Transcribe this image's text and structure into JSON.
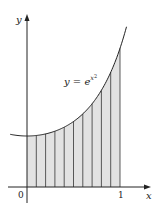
{
  "figure": {
    "function_label": "y = e",
    "exponent": "x",
    "exponent_power": "2",
    "y_axis_label": "y",
    "x_axis_label": "x",
    "origin_label": "0",
    "x_tick_label": "1"
  },
  "chart_data": {
    "type": "area",
    "title": "",
    "function": "y = e^(x^2)",
    "xlabel": "x",
    "ylabel": "y",
    "x_ticks": [
      "0",
      "1"
    ],
    "shaded_interval": [
      0,
      1
    ],
    "num_strips": 10,
    "strip_boundaries": [
      0,
      0.1,
      0.2,
      0.3,
      0.4,
      0.5,
      0.6,
      0.7,
      0.8,
      0.9,
      1.0
    ],
    "curve_values_at_boundaries": [
      1.0,
      1.01,
      1.041,
      1.094,
      1.174,
      1.284,
      1.433,
      1.632,
      1.896,
      2.248,
      2.718
    ],
    "curve_domain_shown": [
      -0.18,
      1.07
    ],
    "grid": false,
    "legend": "none",
    "colors": {
      "shade": "#e2e2e2",
      "line": "#222222"
    }
  }
}
